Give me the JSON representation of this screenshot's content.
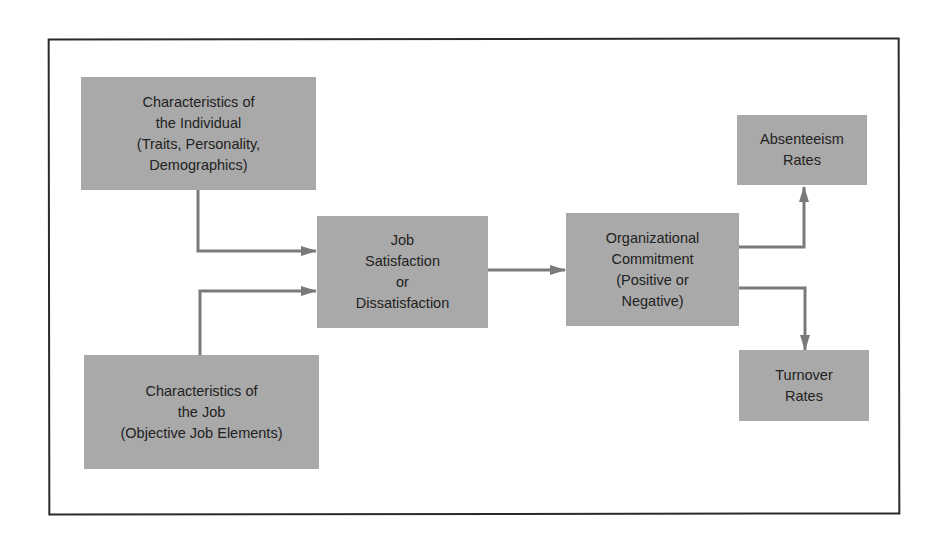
{
  "diagram": {
    "type": "flowchart",
    "nodes": [
      {
        "id": "individual",
        "label": "Characteristics of\nthe Individual\n(Traits, Personality,\nDemographics)"
      },
      {
        "id": "job",
        "label": "Characteristics of\nthe Job\n(Objective Job Elements)"
      },
      {
        "id": "satisfaction",
        "label": "Job\nSatisfaction\nor\nDissatisfaction"
      },
      {
        "id": "commitment",
        "label": "Organizational\nCommitment\n(Positive or\nNegative)"
      },
      {
        "id": "absenteeism",
        "label": "Absenteeism\nRates"
      },
      {
        "id": "turnover",
        "label": "Turnover\nRates"
      }
    ],
    "edges": [
      {
        "from": "individual",
        "to": "satisfaction"
      },
      {
        "from": "job",
        "to": "satisfaction"
      },
      {
        "from": "satisfaction",
        "to": "commitment"
      },
      {
        "from": "commitment",
        "to": "absenteeism"
      },
      {
        "from": "commitment",
        "to": "turnover"
      }
    ],
    "colors": {
      "box_fill": "#a9a9a9",
      "arrow": "#7a7a7a",
      "frame": "#2a2a2a",
      "text": "#222222"
    }
  }
}
